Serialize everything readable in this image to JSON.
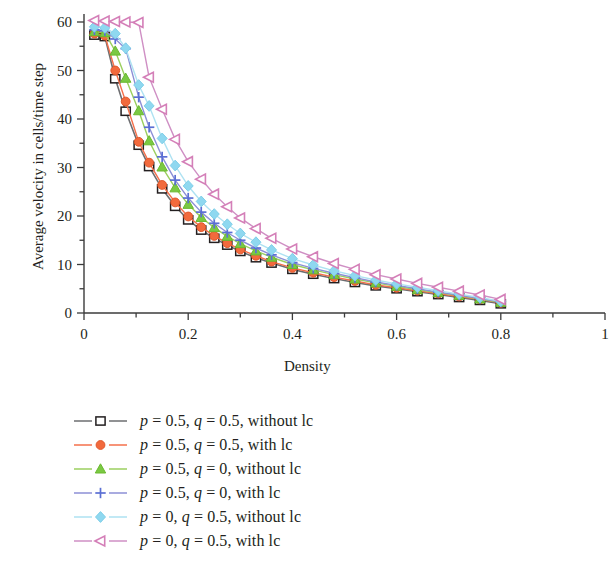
{
  "chart_data": {
    "type": "line",
    "title": "",
    "xlabel": "Density",
    "ylabel": "Average velocity in cells/time step",
    "xlim": [
      0,
      1
    ],
    "ylim": [
      0,
      63
    ],
    "xticks": [
      0,
      0.2,
      0.4,
      0.6,
      0.8,
      1
    ],
    "xticklabels": [
      "0",
      "0.2",
      "0.4",
      "0.6",
      "0.8",
      "1"
    ],
    "yticks": [
      0,
      10,
      20,
      30,
      40,
      50,
      60
    ],
    "yticklabels": [
      "0",
      "10",
      "20",
      "30",
      "40",
      "50",
      "60"
    ],
    "xminor_step": 0.1,
    "yminor_step": 5,
    "grid": false,
    "legend_position": "below-axes",
    "series": [
      {
        "name": "p = 0.5, q = 0.5, without lc",
        "legend_label": "p = 0.5, q = 0.5, without lc",
        "marker": "square-open",
        "color": "#6d6e71",
        "marker_fill": "#ffffff",
        "marker_edge": "#231f20",
        "x": [
          0.02,
          0.04,
          0.06,
          0.08,
          0.105,
          0.125,
          0.15,
          0.175,
          0.2,
          0.225,
          0.25,
          0.275,
          0.3,
          0.33,
          0.36,
          0.4,
          0.44,
          0.48,
          0.52,
          0.56,
          0.6,
          0.64,
          0.68,
          0.72,
          0.76,
          0.8
        ],
        "y": [
          57.3,
          57.0,
          48.3,
          41.6,
          34.6,
          30.2,
          25.6,
          22.0,
          19.2,
          17.1,
          15.4,
          14.0,
          12.7,
          11.4,
          10.3,
          9.0,
          8.0,
          7.1,
          6.3,
          5.6,
          5.0,
          4.4,
          3.8,
          3.2,
          2.6,
          1.9
        ]
      },
      {
        "name": "p = 0.5, q = 0.5, with lc",
        "legend_label": "p = 0.5, q = 0.5, with lc",
        "marker": "circle-filled",
        "color": "#f4704b",
        "marker_fill": "#f26a3d",
        "marker_edge": "#e0562a",
        "x": [
          0.02,
          0.04,
          0.06,
          0.08,
          0.105,
          0.125,
          0.15,
          0.175,
          0.2,
          0.225,
          0.25,
          0.275,
          0.3,
          0.33,
          0.36,
          0.4,
          0.44,
          0.48,
          0.52,
          0.56,
          0.6,
          0.64,
          0.68,
          0.72,
          0.76,
          0.8
        ],
        "y": [
          57.6,
          57.2,
          50.0,
          43.6,
          35.3,
          31.0,
          26.4,
          22.8,
          19.9,
          17.7,
          15.9,
          14.4,
          13.1,
          11.8,
          10.6,
          9.3,
          8.3,
          7.4,
          6.6,
          5.8,
          5.2,
          4.6,
          4.0,
          3.4,
          2.8,
          2.1
        ]
      },
      {
        "name": "p = 0.5, q = 0, without lc",
        "legend_label": "p = 0.5, q = 0, without lc",
        "marker": "triangle-filled",
        "color": "#9bcf5f",
        "marker_fill": "#7ac943",
        "marker_edge": "#6ab82f",
        "x": [
          0.02,
          0.04,
          0.06,
          0.08,
          0.105,
          0.125,
          0.15,
          0.175,
          0.2,
          0.225,
          0.25,
          0.275,
          0.3,
          0.33,
          0.36,
          0.4,
          0.44,
          0.48,
          0.52,
          0.56,
          0.6,
          0.64,
          0.68,
          0.72,
          0.76,
          0.8
        ],
        "y": [
          58.0,
          57.8,
          54.0,
          48.4,
          41.7,
          35.5,
          30.1,
          25.8,
          22.4,
          19.7,
          17.6,
          15.8,
          14.3,
          12.8,
          11.5,
          10.0,
          8.9,
          7.9,
          7.0,
          6.2,
          5.5,
          4.8,
          4.2,
          3.6,
          2.9,
          2.2
        ]
      },
      {
        "name": "p = 0.5, q = 0, with lc",
        "legend_label": "p = 0.5, q = 0, with lc",
        "marker": "plus",
        "color": "#8c8fd6",
        "marker_fill": "#5b6fd4",
        "marker_edge": "#5b6fd4",
        "x": [
          0.02,
          0.04,
          0.06,
          0.08,
          0.105,
          0.125,
          0.15,
          0.175,
          0.2,
          0.225,
          0.25,
          0.275,
          0.3,
          0.33,
          0.36,
          0.4,
          0.44,
          0.48,
          0.52,
          0.56,
          0.6,
          0.64,
          0.68,
          0.72,
          0.76,
          0.8
        ],
        "y": [
          58.4,
          58.2,
          56.5,
          54.5,
          44.5,
          38.3,
          32.2,
          27.4,
          23.7,
          20.8,
          18.5,
          16.6,
          15.0,
          13.4,
          12.0,
          10.4,
          9.2,
          8.2,
          7.3,
          6.4,
          5.7,
          5.0,
          4.3,
          3.7,
          3.0,
          2.3
        ]
      },
      {
        "name": "p = 0, q = 0.5, without lc",
        "legend_label": "p = 0, q = 0.5, without lc",
        "marker": "diamond-filled",
        "color": "#aee2f2",
        "marker_fill": "#8fd8f0",
        "marker_edge": "#7fcfe8",
        "x": [
          0.02,
          0.04,
          0.06,
          0.08,
          0.105,
          0.125,
          0.15,
          0.175,
          0.2,
          0.225,
          0.25,
          0.275,
          0.3,
          0.33,
          0.36,
          0.4,
          0.44,
          0.48,
          0.52,
          0.56,
          0.6,
          0.64,
          0.68,
          0.72,
          0.76,
          0.8
        ],
        "y": [
          59.0,
          58.8,
          57.6,
          54.6,
          47.0,
          42.7,
          36.0,
          30.4,
          26.2,
          23.0,
          20.4,
          18.3,
          16.4,
          14.6,
          13.0,
          11.2,
          9.9,
          8.7,
          7.7,
          6.8,
          6.0,
          5.3,
          4.6,
          3.9,
          3.2,
          2.4
        ]
      },
      {
        "name": "p = 0, q = 0.5, with lc",
        "legend_label": "p = 0, q = 0.5, with lc",
        "marker": "triangle-left-open",
        "color": "#cf8fc4",
        "marker_fill": "#ffffff",
        "marker_edge": "#d47fb8",
        "x": [
          0.02,
          0.04,
          0.06,
          0.08,
          0.105,
          0.125,
          0.15,
          0.175,
          0.2,
          0.225,
          0.25,
          0.275,
          0.3,
          0.33,
          0.36,
          0.4,
          0.44,
          0.48,
          0.52,
          0.56,
          0.6,
          0.64,
          0.68,
          0.72,
          0.76,
          0.8
        ],
        "y": [
          60.3,
          60.2,
          60.1,
          60.0,
          59.9,
          48.6,
          42.0,
          35.8,
          31.2,
          27.6,
          24.5,
          21.9,
          19.6,
          17.4,
          15.4,
          13.2,
          11.6,
          10.2,
          9.0,
          7.9,
          7.0,
          6.1,
          5.3,
          4.5,
          3.7,
          2.8
        ]
      }
    ]
  },
  "axes": {
    "x_axis_name": "density-axis",
    "y_axis_name": "velocity-axis"
  }
}
